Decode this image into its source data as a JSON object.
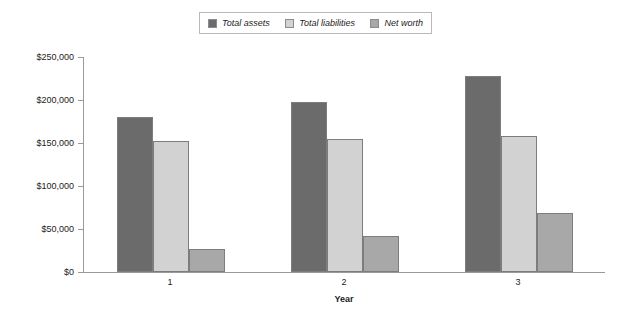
{
  "chart_data": {
    "type": "bar",
    "title": "",
    "xlabel": "Year",
    "ylabel": "",
    "categories": [
      "1",
      "2",
      "3"
    ],
    "series": [
      {
        "name": "Total assets",
        "color": "#6b6b6b",
        "values": [
          180000,
          198000,
          228000
        ]
      },
      {
        "name": "Total liabilities",
        "color": "#d2d2d2",
        "values": [
          152000,
          155000,
          158000
        ]
      },
      {
        "name": "Net worth",
        "color": "#a8a8a8",
        "values": [
          27000,
          42000,
          69000
        ]
      }
    ],
    "ylim": [
      0,
      250000
    ],
    "ytick_labels": [
      "$250,000",
      "$200,000",
      "$150,000",
      "$100,000",
      "$50,000",
      "$0"
    ],
    "ytick_values": [
      250000,
      200000,
      150000,
      100000,
      50000,
      0
    ],
    "grid": false,
    "legend_position": "top-center"
  },
  "legend": {
    "entries": [
      {
        "label": "Total assets"
      },
      {
        "label": "Total liabilities"
      },
      {
        "label": "Net worth"
      }
    ]
  }
}
